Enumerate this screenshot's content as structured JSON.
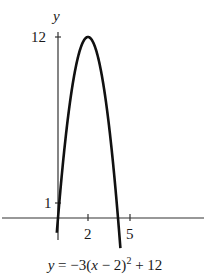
{
  "chart_data": {
    "type": "line",
    "title": "",
    "equation": "y = -3(x - 2)^2 + 12",
    "xlabel": "",
    "ylabel": "y",
    "x_ticks": [
      2,
      5
    ],
    "y_ticks": [
      1,
      12
    ],
    "vertex": [
      2,
      12
    ],
    "x_intercepts": [
      0,
      4
    ],
    "series": [
      {
        "name": "y = -3(x - 2)^2 + 12",
        "x": [
          -0.05,
          0,
          0.5,
          1,
          1.5,
          2,
          2.5,
          3,
          3.5,
          4,
          4.15
        ],
        "y": [
          -0.6,
          0,
          5.25,
          9,
          11.25,
          12,
          11.25,
          9,
          5.25,
          0,
          -1.9
        ]
      }
    ],
    "grid": false,
    "legend": "none"
  },
  "labels": {
    "y_axis": "y",
    "y_tick_12": "12",
    "y_tick_1": "1",
    "x_tick_2": "2",
    "x_tick_5": "5",
    "eq_prefix": "y",
    "eq_mid1": " = −3(",
    "eq_x": "x",
    "eq_mid2": " − 2)",
    "eq_exp": "2",
    "eq_tail": " + 12"
  },
  "colors": {
    "curve": "#111111",
    "axis": "#333333",
    "background": "#ffffff"
  }
}
